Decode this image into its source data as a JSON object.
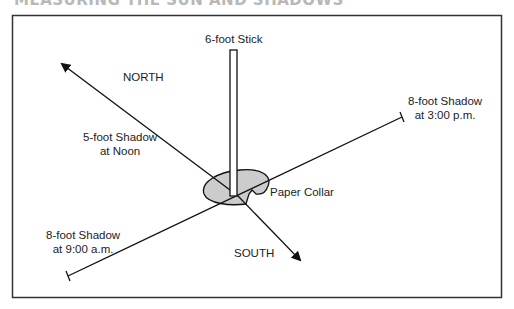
{
  "title": "MEASURING THE SUN AND SHADOWS",
  "diagram": {
    "stick_label": "6-foot Stick",
    "north_label": "NORTH",
    "south_label": "SOUTH",
    "collar_label": "Paper Collar",
    "noon_shadow": {
      "line1": "5-foot Shadow",
      "line2": "at Noon"
    },
    "pm_shadow": {
      "line1": "8-foot Shadow",
      "line2": "at 3:00 p.m."
    },
    "am_shadow": {
      "line1": "8-foot Shadow",
      "line2": "at 9:00 a.m."
    },
    "colors": {
      "collar_fill": "#cccccc",
      "line": "#111111",
      "frame": "#333333"
    }
  }
}
